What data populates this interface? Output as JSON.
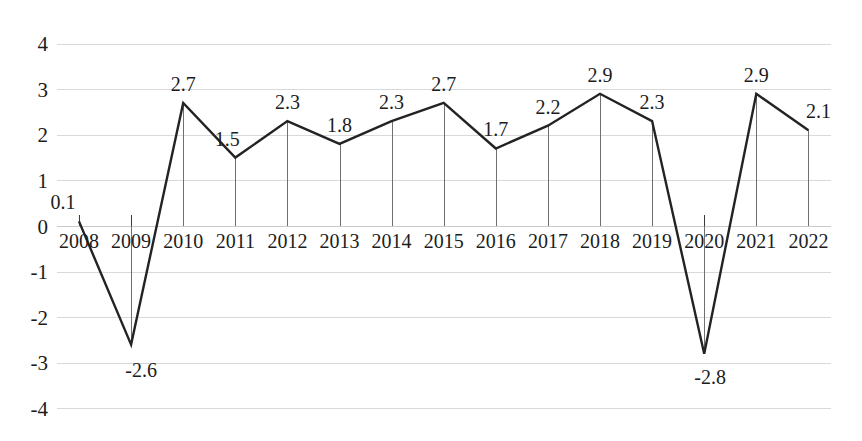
{
  "chart_data": {
    "type": "line",
    "title": "",
    "subtitle": "",
    "xlabel": "",
    "ylabel": "",
    "categories": [
      "2008",
      "2009",
      "2010",
      "2011",
      "2012",
      "2013",
      "2014",
      "2015",
      "2016",
      "2017",
      "2018",
      "2019",
      "2020",
      "2021",
      "2022"
    ],
    "values": [
      0.1,
      -2.6,
      2.7,
      1.5,
      2.3,
      1.8,
      2.3,
      2.7,
      1.7,
      2.2,
      2.9,
      2.3,
      -2.8,
      2.9,
      2.1
    ],
    "point_labels": [
      "0.1",
      "-2.6",
      "2.7",
      "1.5",
      "2.3",
      "1.8",
      "2.3",
      "2.7",
      "1.7",
      "2.2",
      "2.9",
      "2.3",
      "-2.8",
      "2.9",
      "2.1"
    ],
    "ylim": [
      -4,
      4
    ],
    "yticks": [
      4,
      3,
      2,
      1,
      0,
      -1,
      -2,
      -3,
      -4
    ],
    "ytick_labels": [
      "4",
      "3",
      "2",
      "1",
      "0",
      "-1",
      "-2",
      "-3",
      "-4"
    ],
    "grid": true,
    "grid_axis": "y",
    "legend": "none",
    "series": [
      {
        "name": "",
        "values": [
          0.1,
          -2.6,
          2.7,
          1.5,
          2.3,
          1.8,
          2.3,
          2.7,
          1.7,
          2.2,
          2.9,
          2.3,
          -2.8,
          2.9,
          2.1
        ]
      }
    ],
    "colors": {
      "line": "#232323",
      "gridline": "#d9d9d9",
      "dropline": "#6f6f6f",
      "text": "#1c1c1c",
      "background": "#ffffff"
    },
    "label_offsets": [
      {
        "dx": -16,
        "dy": -12
      },
      {
        "dx": 10,
        "dy": 32
      },
      {
        "dx": 0,
        "dy": -12
      },
      {
        "dx": -8,
        "dy": -12
      },
      {
        "dx": 0,
        "dy": -12
      },
      {
        "dx": 0,
        "dy": -12
      },
      {
        "dx": 0,
        "dy": -12
      },
      {
        "dx": 0,
        "dy": -12
      },
      {
        "dx": 0,
        "dy": -12
      },
      {
        "dx": 0,
        "dy": -12
      },
      {
        "dx": 0,
        "dy": -12
      },
      {
        "dx": 0,
        "dy": -12
      },
      {
        "dx": 6,
        "dy": 30
      },
      {
        "dx": 0,
        "dy": -12
      },
      {
        "dx": 10,
        "dy": -12
      }
    ]
  }
}
